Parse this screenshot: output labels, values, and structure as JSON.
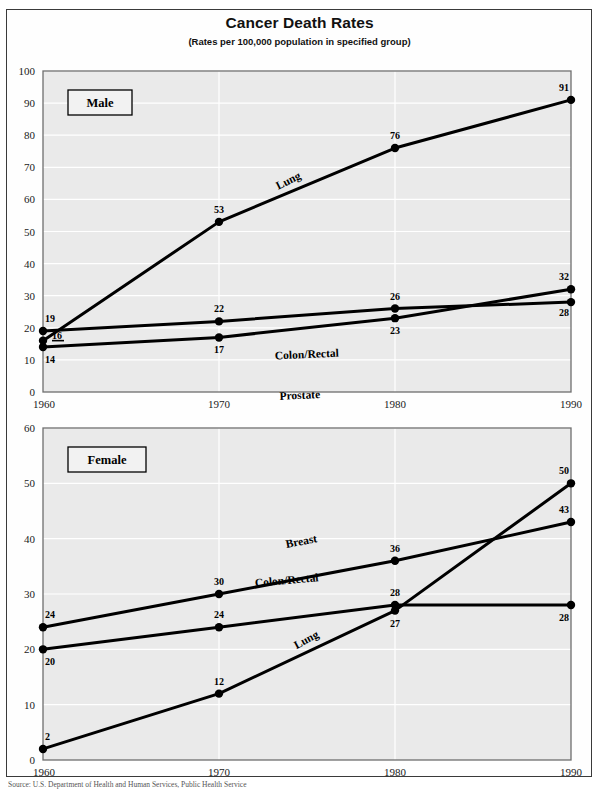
{
  "page": {
    "title": "Cancer Death Rates",
    "subtitle": "(Rates per 100,000 population in specified group)",
    "source_note": "Source: U.S. Department of Health and Human Services, Public Health Service"
  },
  "colors": {
    "line": "#000000",
    "plot_background": "#eaeaea",
    "grid": "#ffffff",
    "axis": "#6e6e6e",
    "page_border": "#3a3a3a",
    "text": "#000000"
  },
  "chart_data": [
    {
      "type": "line",
      "title": "Male",
      "panel_label": "Male",
      "xlabel": "",
      "ylabel": "",
      "x": [
        1960,
        1970,
        1980,
        1990
      ],
      "xtick_labels": [
        "1960",
        "1970",
        "1980",
        "1990"
      ],
      "xlim": [
        1960,
        1990
      ],
      "ylim": [
        0,
        100
      ],
      "ytick_labels": [
        "0",
        "10",
        "20",
        "30",
        "40",
        "50",
        "60",
        "70",
        "80",
        "90",
        "100"
      ],
      "yticks": [
        0,
        10,
        20,
        30,
        40,
        50,
        60,
        70,
        80,
        90,
        100
      ],
      "grid": true,
      "legend": "inline-labels",
      "series": [
        {
          "name": "Lung",
          "label": "Lung",
          "values": [
            16,
            53,
            76,
            91
          ],
          "point_labels": [
            "16",
            "53",
            "76",
            "91"
          ]
        },
        {
          "name": "Colon/Rectal",
          "label": "Colon/Rectal",
          "values": [
            19,
            22,
            26,
            28
          ],
          "point_labels": [
            "19",
            "22",
            "26",
            "28"
          ]
        },
        {
          "name": "Prostate",
          "label": "Prostate",
          "values": [
            14,
            17,
            23,
            32
          ],
          "point_labels": [
            "14",
            "17",
            "23",
            "32"
          ]
        }
      ]
    },
    {
      "type": "line",
      "title": "Female",
      "panel_label": "Female",
      "xlabel": "",
      "ylabel": "",
      "x": [
        1960,
        1970,
        1980,
        1990
      ],
      "xtick_labels": [
        "1960",
        "1970",
        "1980",
        "1990"
      ],
      "xlim": [
        1960,
        1990
      ],
      "ylim": [
        0,
        60
      ],
      "ytick_labels": [
        "0",
        "10",
        "20",
        "30",
        "40",
        "50",
        "60"
      ],
      "yticks": [
        0,
        10,
        20,
        30,
        40,
        50,
        60
      ],
      "grid": true,
      "legend": "inline-labels",
      "series": [
        {
          "name": "Breast",
          "label": "Breast",
          "values": [
            24,
            30,
            36,
            43
          ],
          "point_labels": [
            "24",
            "30",
            "36",
            "43"
          ]
        },
        {
          "name": "Colon/Rectal",
          "label": "Colon/Rectal",
          "values": [
            20,
            24,
            28,
            28
          ],
          "point_labels": [
            "20",
            "24",
            "28",
            "28"
          ]
        },
        {
          "name": "Lung",
          "label": "Lung",
          "values": [
            2,
            12,
            27,
            50
          ],
          "point_labels": [
            "2",
            "12",
            "27",
            "50"
          ]
        }
      ]
    }
  ]
}
